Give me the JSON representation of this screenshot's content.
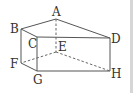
{
  "diagram": {
    "type": "triangular-prism",
    "vertices": {
      "A": {
        "label": "A",
        "x": 56,
        "y": 19
      },
      "B": {
        "label": "B",
        "x": 21,
        "y": 29
      },
      "C": {
        "label": "C",
        "x": 37,
        "y": 37
      },
      "D": {
        "label": "D",
        "x": 110,
        "y": 38
      },
      "E": {
        "label": "E",
        "x": 56,
        "y": 52
      },
      "F": {
        "label": "F",
        "x": 21,
        "y": 63
      },
      "G": {
        "label": "G",
        "x": 37,
        "y": 71
      },
      "H": {
        "label": "H",
        "x": 110,
        "y": 71
      }
    },
    "visible_edges": [
      "AB",
      "BC",
      "CD",
      "AD",
      "BF",
      "FG",
      "CG",
      "GH",
      "DH"
    ],
    "hidden_edges": [
      "AE",
      "EF",
      "EH"
    ],
    "labels": {
      "A": "A",
      "B": "B",
      "C": "C",
      "D": "D",
      "E": "E",
      "F": "F",
      "G": "G",
      "H": "H"
    }
  }
}
